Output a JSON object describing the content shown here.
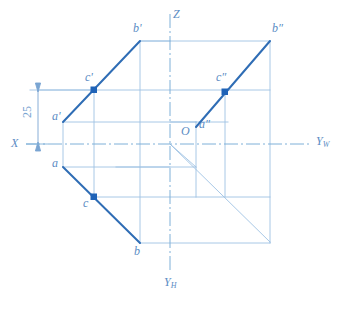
{
  "drawing": {
    "title": "Three-view projection of line segment AB with point C",
    "type": "descriptive-geometry-projection",
    "canvas": {
      "width": 342,
      "height": 311
    },
    "colors": {
      "bold_line": "#2f6db5",
      "thin_line": "#8fb8dd",
      "axis_line": "#7fb0d8",
      "label": "#5b8cc4",
      "point_marker": "#1f63b8",
      "background": "#ffffff"
    },
    "axes": [
      {
        "name": "X",
        "label": "X",
        "label_pos": {
          "x": 11,
          "y": 137
        }
      },
      {
        "name": "Z",
        "label": "Z",
        "label_pos": {
          "x": 173,
          "y": 8
        }
      },
      {
        "name": "Yw",
        "label": "Y",
        "sub": "W",
        "label_pos": {
          "x": 316,
          "y": 135
        }
      },
      {
        "name": "Yh",
        "label": "Y",
        "sub": "H",
        "label_pos": {
          "x": 164,
          "y": 276
        }
      }
    ],
    "origin": {
      "label": "O",
      "label_pos": {
        "x": 181,
        "y": 125
      },
      "point": {
        "x": 170,
        "y": 144
      }
    },
    "dimension": {
      "value": "25",
      "label_pos": {
        "x": 22,
        "y": 107
      },
      "line_x": 38,
      "from_y": 90,
      "to_y": 144
    },
    "points": [
      {
        "id": "a-prime",
        "label": "a'",
        "x": 63,
        "y": 122,
        "label_pos": {
          "x": 52,
          "y": 110
        },
        "marker": false
      },
      {
        "id": "b-prime",
        "label": "b'",
        "x": 140,
        "y": 41,
        "label_pos": {
          "x": 133,
          "y": 22
        },
        "marker": false
      },
      {
        "id": "c-prime",
        "label": "c'",
        "x": 94,
        "y": 90,
        "label_pos": {
          "x": 85,
          "y": 71
        },
        "marker": true
      },
      {
        "id": "a",
        "label": "a",
        "x": 63,
        "y": 167,
        "label_pos": {
          "x": 52,
          "y": 157
        },
        "marker": false
      },
      {
        "id": "b",
        "label": "b",
        "x": 140,
        "y": 243,
        "label_pos": {
          "x": 134,
          "y": 245
        },
        "marker": false
      },
      {
        "id": "c",
        "label": "c",
        "x": 94,
        "y": 197,
        "label_pos": {
          "x": 83,
          "y": 197
        },
        "marker": true
      },
      {
        "id": "a-dprime",
        "label": "a″",
        "x": 196,
        "y": 127,
        "label_pos": {
          "x": 199,
          "y": 118
        },
        "marker": false
      },
      {
        "id": "b-dprime",
        "label": "b″",
        "x": 270,
        "y": 41,
        "label_pos": {
          "x": 272,
          "y": 22
        },
        "marker": false
      },
      {
        "id": "c-dprime",
        "label": "c″",
        "x": 225,
        "y": 92,
        "label_pos": {
          "x": 216,
          "y": 71
        },
        "marker": true
      }
    ],
    "bold_segments": [
      {
        "name": "frontal-projection-a'b'",
        "x1": 63,
        "y1": 122,
        "x2": 140,
        "y2": 41
      },
      {
        "name": "horizontal-projection-ab",
        "x1": 63,
        "y1": 167,
        "x2": 140,
        "y2": 243
      },
      {
        "name": "profile-projection-a''b''",
        "x1": 196,
        "y1": 127,
        "x2": 270,
        "y2": 41
      }
    ]
  }
}
